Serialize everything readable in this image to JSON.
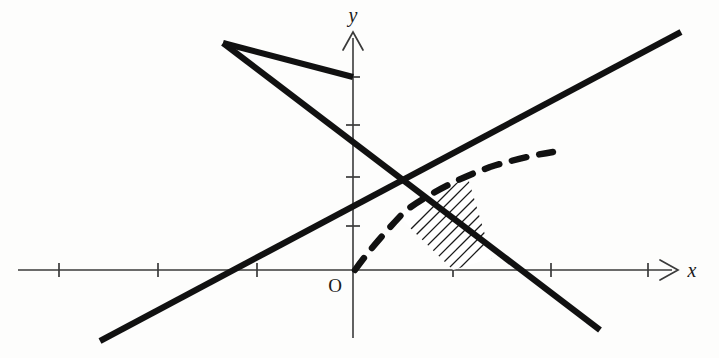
{
  "figure": {
    "background_color": "#fdfdfc",
    "line_color": "#111111",
    "axis_color": "#3a3a3a"
  },
  "axes": {
    "x_axis": {
      "label": "x",
      "label_position": "right-end",
      "arrow": true,
      "y_pixel": 270,
      "x_start_pixel": 18,
      "x_end_pixel": 676,
      "tick_pixels": [
        59,
        158,
        257,
        453,
        551,
        648
      ],
      "tick_length": 14
    },
    "y_axis": {
      "label": "y",
      "label_position": "top-end",
      "arrow": true,
      "x_pixel": 353,
      "y_start_pixel": 338,
      "y_end_pixel": 33,
      "tick_pixels": [
        77,
        125,
        177,
        226
      ],
      "tick_length": 14
    },
    "origin": {
      "label": "O",
      "x_pixel": 353,
      "y_pixel": 270,
      "label_offset_x": -18,
      "label_offset_y": 22
    },
    "unit_x_pixels": 99,
    "unit_y_pixels": 49.5
  },
  "graph_data": {
    "type": "line-diagram",
    "lines": [
      {
        "name": "descending-line",
        "description": "straight line falling from upper-left to lower-right through the apex",
        "from": [
          223,
          43
        ],
        "to": [
          600,
          330
        ],
        "style": "solid-thick"
      },
      {
        "name": "ascending-line",
        "description": "straight line rising from lower-left to upper-right crossing x-axis",
        "from": [
          100,
          341
        ],
        "to": [
          681,
          32
        ],
        "style": "solid-thick"
      },
      {
        "name": "apex-left-branch",
        "description": "left branch of the V rising to the apex on the y-axis",
        "from": [
          223,
          43
        ],
        "to": [
          353,
          77
        ],
        "style": "solid-thick"
      }
    ],
    "curve": {
      "name": "dashed-curve",
      "description": "dashed concave square-root style curve starting at origin rising to the right",
      "style": "dashed-thick",
      "points": [
        [
          355,
          270
        ],
        [
          364,
          255
        ],
        [
          375,
          240
        ],
        [
          389,
          226
        ],
        [
          405,
          211
        ],
        [
          423,
          198
        ],
        [
          444,
          186
        ],
        [
          468,
          175
        ],
        [
          494,
          166
        ],
        [
          522,
          158
        ],
        [
          553,
          152
        ]
      ]
    },
    "shaded_region": {
      "name": "hatched-region",
      "description": "region bounded by the dashed curve above, the ascending line on the left and the descending line on the right, hatched with parallel lines",
      "vertices": [
        [
          453,
          270
        ],
        [
          397,
          215
        ],
        [
          410,
          206
        ],
        [
          428,
          195
        ],
        [
          448,
          186
        ],
        [
          468,
          178
        ],
        [
          492,
          258
        ]
      ],
      "hatch_angle_degrees": 45,
      "hatch_spacing_pixels": 11,
      "hatch_count": 10
    }
  }
}
